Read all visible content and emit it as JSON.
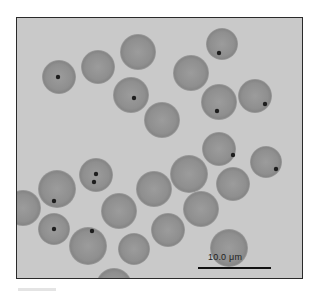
{
  "figure": {
    "background_color": "#c9c9c9",
    "cell_color": "#929292",
    "dot_color": "#1e1e1e",
    "frame": {
      "x": 16,
      "y": 17,
      "width": 287,
      "height": 262
    }
  },
  "cells": [
    {
      "cx": 58,
      "cy": 76,
      "r": 17,
      "dots": [
        [
          57,
          76
        ]
      ]
    },
    {
      "cx": 97,
      "cy": 66,
      "r": 17,
      "dots": []
    },
    {
      "cx": 137,
      "cy": 51,
      "r": 18,
      "dots": []
    },
    {
      "cx": 130,
      "cy": 94,
      "r": 18,
      "dots": [
        [
          133,
          97
        ]
      ]
    },
    {
      "cx": 161,
      "cy": 119,
      "r": 18,
      "dots": []
    },
    {
      "cx": 221,
      "cy": 43,
      "r": 16,
      "dots": [
        [
          218,
          52
        ]
      ]
    },
    {
      "cx": 190,
      "cy": 72,
      "r": 18,
      "dots": []
    },
    {
      "cx": 218,
      "cy": 101,
      "r": 18,
      "dots": [
        [
          216,
          110
        ]
      ]
    },
    {
      "cx": 254,
      "cy": 95,
      "r": 17,
      "dots": [
        [
          264,
          103
        ]
      ]
    },
    {
      "cx": 218,
      "cy": 148,
      "r": 17,
      "dots": [
        [
          232,
          154
        ]
      ]
    },
    {
      "cx": 265,
      "cy": 161,
      "r": 16,
      "dots": [
        [
          275,
          168
        ]
      ]
    },
    {
      "cx": 188,
      "cy": 173,
      "r": 19,
      "dots": []
    },
    {
      "cx": 232,
      "cy": 183,
      "r": 17,
      "dots": []
    },
    {
      "cx": 153,
      "cy": 188,
      "r": 18,
      "dots": []
    },
    {
      "cx": 95,
      "cy": 174,
      "r": 17,
      "dots": [
        [
          95,
          173
        ],
        [
          93,
          181
        ]
      ]
    },
    {
      "cx": 56,
      "cy": 188,
      "r": 19,
      "dots": [
        [
          53,
          200
        ]
      ]
    },
    {
      "cx": 22,
      "cy": 207,
      "r": 18,
      "dots": []
    },
    {
      "cx": 53,
      "cy": 228,
      "r": 16,
      "dots": [
        [
          53,
          228
        ]
      ]
    },
    {
      "cx": 118,
      "cy": 210,
      "r": 18,
      "dots": []
    },
    {
      "cx": 200,
      "cy": 208,
      "r": 18,
      "dots": []
    },
    {
      "cx": 167,
      "cy": 229,
      "r": 17,
      "dots": []
    },
    {
      "cx": 87,
      "cy": 245,
      "r": 19,
      "dots": [
        [
          91,
          230
        ]
      ]
    },
    {
      "cx": 133,
      "cy": 248,
      "r": 16,
      "dots": []
    },
    {
      "cx": 228,
      "cy": 247,
      "r": 19,
      "dots": []
    },
    {
      "cx": 113,
      "cy": 285,
      "r": 18,
      "dots": []
    }
  ],
  "scale_bar": {
    "label": "10.0 μm",
    "x1": 197,
    "x2": 270,
    "y": 266,
    "label_x": 207,
    "label_y": 251
  }
}
